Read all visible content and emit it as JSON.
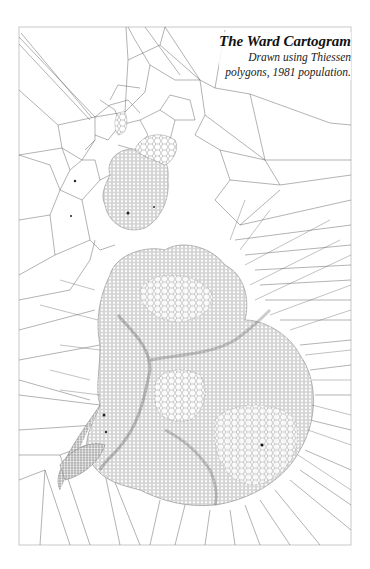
{
  "map": {
    "title": "The Ward Cartogram",
    "subtitle_line1": "Drawn using Thiessen",
    "subtitle_line2": "polygons, 1981 population.",
    "type": "cartogram",
    "method": "Thiessen polygons",
    "population_year": "1981",
    "colors": {
      "background": "#ffffff",
      "lines": "#555555",
      "frame": "#bbbbbb",
      "dense_fill": "#9a9a9a"
    }
  }
}
